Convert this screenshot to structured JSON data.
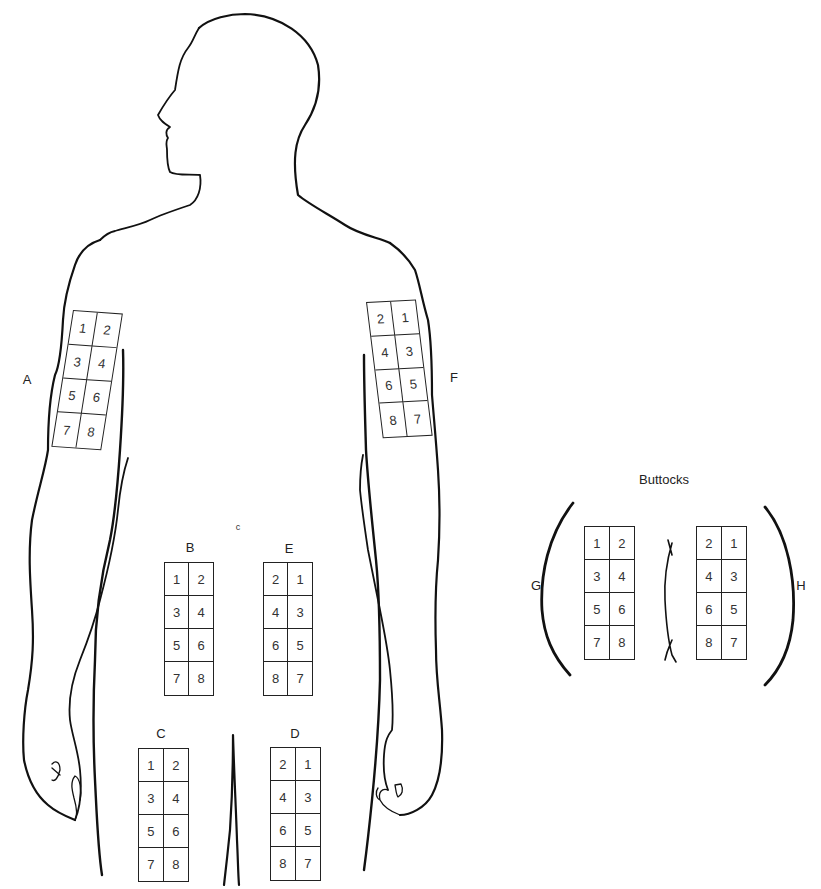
{
  "diagram": {
    "type": "injection-site-rotation-chart",
    "sections": [
      {
        "id": "A",
        "label": "A",
        "region": "right-upper-arm",
        "cells": [
          "1",
          "2",
          "3",
          "4",
          "5",
          "6",
          "7",
          "8"
        ]
      },
      {
        "id": "B",
        "label": "B",
        "region": "right-abdomen",
        "cells": [
          "1",
          "2",
          "3",
          "4",
          "5",
          "6",
          "7",
          "8"
        ]
      },
      {
        "id": "C",
        "label": "C",
        "region": "right-thigh",
        "cells": [
          "1",
          "2",
          "3",
          "4",
          "5",
          "6",
          "7",
          "8"
        ]
      },
      {
        "id": "D",
        "label": "D",
        "region": "left-thigh",
        "cells": [
          "2",
          "1",
          "4",
          "3",
          "6",
          "5",
          "8",
          "7"
        ]
      },
      {
        "id": "E",
        "label": "E",
        "region": "left-abdomen",
        "cells": [
          "2",
          "1",
          "4",
          "3",
          "6",
          "5",
          "8",
          "7"
        ]
      },
      {
        "id": "F",
        "label": "F",
        "region": "left-upper-arm",
        "cells": [
          "2",
          "1",
          "4",
          "3",
          "6",
          "5",
          "8",
          "7"
        ]
      },
      {
        "id": "G",
        "label": "G",
        "region": "right-buttock",
        "cells": [
          "1",
          "2",
          "3",
          "4",
          "5",
          "6",
          "7",
          "8"
        ]
      },
      {
        "id": "H",
        "label": "H",
        "region": "left-buttock",
        "cells": [
          "2",
          "1",
          "4",
          "3",
          "6",
          "5",
          "8",
          "7"
        ]
      }
    ],
    "buttocks_title": "Buttocks",
    "navel_mark": "c",
    "line_color": "#111111",
    "background": "#ffffff"
  }
}
